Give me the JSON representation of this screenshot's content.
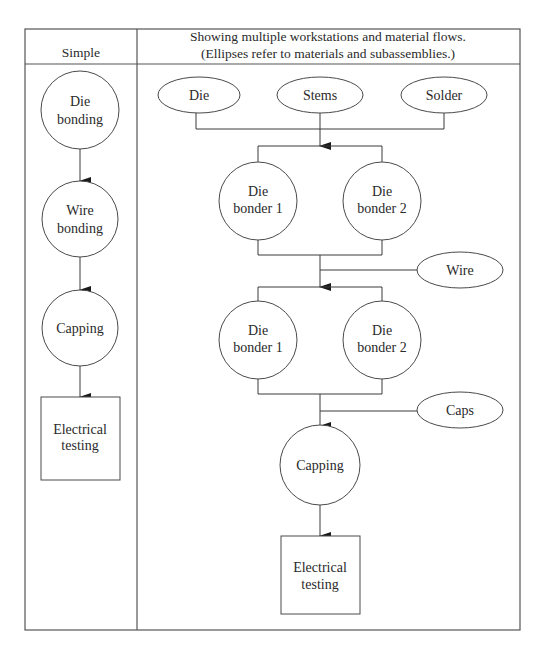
{
  "header": {
    "left_title": "Simple",
    "right_title_line1": "Showing multiple workstations and material flows.",
    "right_title_line2": "(Ellipses refer to materials and subassemblies.)"
  },
  "simple": {
    "steps": [
      {
        "line1": "Die",
        "line2": "bonding",
        "shape": "circle"
      },
      {
        "line1": "Wire",
        "line2": "bonding",
        "shape": "circle"
      },
      {
        "line1": "Capping",
        "line2": "",
        "shape": "circle"
      },
      {
        "line1": "Electrical",
        "line2": "testing",
        "shape": "square"
      }
    ]
  },
  "multi": {
    "materials_top": [
      "Die",
      "Stems",
      "Solder"
    ],
    "stage1": [
      {
        "line1": "Die",
        "line2": "bonder 1"
      },
      {
        "line1": "Die",
        "line2": "bonder 2"
      }
    ],
    "material_wire": "Wire",
    "stage2": [
      {
        "line1": "Die",
        "line2": "bonder 1"
      },
      {
        "line1": "Die",
        "line2": "bonder 2"
      }
    ],
    "material_caps": "Caps",
    "capping": "Capping",
    "testing_line1": "Electrical",
    "testing_line2": "testing"
  }
}
